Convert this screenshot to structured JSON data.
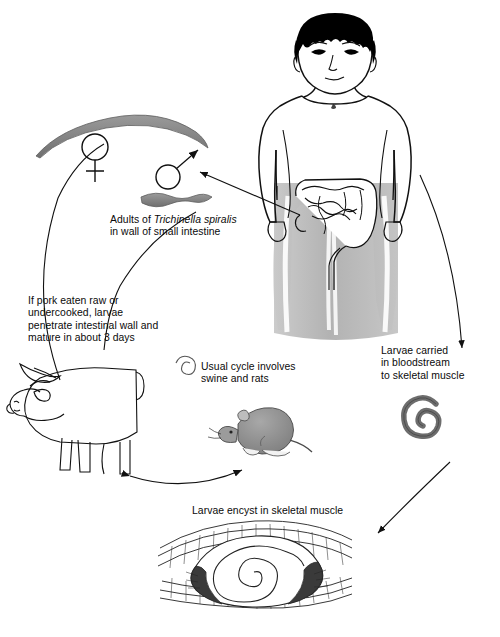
{
  "figure": {
    "organism": "Trichinella spiralis",
    "caption": "",
    "background_color": "#ffffff",
    "ink_color": "#111111",
    "worm_fill": "#8c8c8c",
    "body_shade": "#b9b9b9",
    "hair_color": "#000000"
  },
  "labels": {
    "adults": {
      "line1_pre": "Adults of ",
      "line1_italic": "Trichinella spiralis",
      "line2": "in wall of small intestine"
    },
    "pork": {
      "line1": "If pork eaten raw or",
      "line2": "undercooked, larvae",
      "line3": "penetrate intestinal wall and",
      "line4": "mature in about 3 days"
    },
    "usual_cycle": {
      "line1": "Usual cycle involves",
      "line2": "swine and rats"
    },
    "bloodstream": {
      "line1": "Larvae carried",
      "line2": "in bloodstream",
      "line3": "to skeletal muscle"
    },
    "encyst": {
      "line1": "Larvae encyst in skeletal muscle"
    }
  },
  "symbols": {
    "female": "female-sex-symbol",
    "male": "male-sex-symbol"
  },
  "illustrations": [
    {
      "name": "adult-female-worm",
      "description": "Large curved gray adult female worm, upper left"
    },
    {
      "name": "adult-male-worm",
      "description": "Smaller wavy gray adult male worm, upper center"
    },
    {
      "name": "human-figure",
      "description": "Male human torso, head and arms, with shaded lower body"
    },
    {
      "name": "intestine",
      "description": "Small and large intestine coils in abdomen"
    },
    {
      "name": "pig",
      "description": "Line-art pig facing left, lower left"
    },
    {
      "name": "rat",
      "description": "Gray rat facing left, lower center"
    },
    {
      "name": "coiled-larva",
      "description": "Coiled spiral larva, right side"
    },
    {
      "name": "encysted-larva-muscle",
      "description": "Spiral larva encysted inside striated skeletal muscle fibers, bottom"
    }
  ],
  "arrows": [
    {
      "name": "arrow-intestine-to-worms",
      "from": "intestine",
      "to": "adult-worms"
    },
    {
      "name": "arrow-male-worm-pointer",
      "from": "male-symbol",
      "to": "male-worm"
    },
    {
      "name": "arrow-pig-to-adults",
      "from": "pig",
      "to": "adult-worms"
    },
    {
      "name": "arrow-pig-rat-cycle",
      "from": "pig",
      "to": "rat",
      "bidirectional": true
    },
    {
      "name": "arrow-human-to-coiled-larva",
      "from": "human-body",
      "to": "coiled-larva"
    },
    {
      "name": "arrow-coiled-larva-to-muscle",
      "from": "coiled-larva",
      "to": "encysted-larva-muscle"
    }
  ]
}
